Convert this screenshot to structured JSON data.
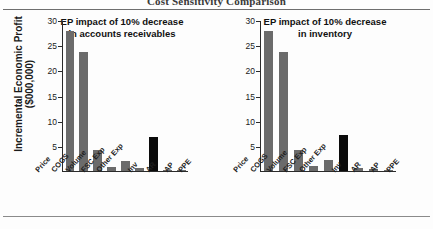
{
  "document": {
    "title": "Cost Sensitivity Comparison"
  },
  "axis": {
    "y_label_line1": "Incremental Economic Profit",
    "y_label_line2": "($000,000)",
    "ticks": [
      "5",
      "10",
      "15",
      "20",
      "25",
      "30"
    ]
  },
  "colors": {
    "bar": "#6b6b6b",
    "highlight": "#0b0b0b",
    "axis": "#2b2b2b",
    "rule": "#6e6e6e"
  },
  "charts": [
    {
      "title_line1": "EP impact of 10% decrease",
      "title_line2": "in accounts receivables",
      "highlight_category": "AR"
    },
    {
      "title_line1": "EP impact of 10% decrease",
      "title_line2": "in inventory",
      "highlight_category": "Inv"
    }
  ],
  "chart_data": [
    {
      "type": "bar",
      "title": "EP impact of 10% decrease in accounts receivables",
      "xlabel": "",
      "ylabel": "Incremental Economic Profit ($000,000)",
      "ylim": [
        0,
        30
      ],
      "yticks": [
        5,
        10,
        15,
        20,
        25,
        30
      ],
      "grid": false,
      "legend": "none",
      "categories": [
        "Price",
        "COGS",
        "Volume",
        "FSC Exp",
        "Other Exp",
        "Inv",
        "AR",
        "AP",
        "PPE"
      ],
      "values": [
        28.1,
        23.8,
        4.3,
        0.8,
        2.1,
        0.7,
        6.8,
        0.3,
        0.1
      ],
      "highlight_index": 6,
      "colors": [
        "#6b6b6b",
        "#6b6b6b",
        "#6b6b6b",
        "#6b6b6b",
        "#6b6b6b",
        "#6b6b6b",
        "#0b0b0b",
        "#6b6b6b",
        "#6b6b6b"
      ]
    },
    {
      "type": "bar",
      "title": "EP impact of 10% decrease in inventory",
      "xlabel": "",
      "ylabel": "Incremental Economic Profit ($000,000)",
      "ylim": [
        0,
        30
      ],
      "yticks": [
        5,
        10,
        15,
        20,
        25,
        30
      ],
      "grid": false,
      "legend": "none",
      "categories": [
        "Price",
        "COGS",
        "Volume",
        "FSC Exp",
        "Other Exp",
        "Inv",
        "AR",
        "AP",
        "PPE"
      ],
      "values": [
        28.1,
        23.8,
        4.3,
        1.0,
        2.2,
        7.3,
        0.6,
        0.4,
        0.1
      ],
      "highlight_index": 5,
      "colors": [
        "#6b6b6b",
        "#6b6b6b",
        "#6b6b6b",
        "#6b6b6b",
        "#6b6b6b",
        "#0b0b0b",
        "#6b6b6b",
        "#6b6b6b",
        "#6b6b6b"
      ]
    }
  ]
}
